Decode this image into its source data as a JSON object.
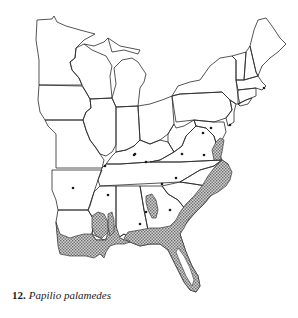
{
  "figure": {
    "number": "12.",
    "species": "Papilio palamedes"
  },
  "map": {
    "region": "Eastern United States",
    "legend": {
      "stippled_area": "range",
      "dots": "isolated records"
    },
    "colors": {
      "outline": "#2a2a2a",
      "stipple": "#8a8a8a",
      "background": "#ffffff"
    }
  }
}
